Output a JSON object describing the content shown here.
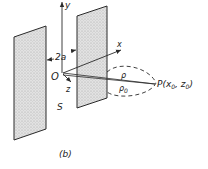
{
  "figure": {
    "caption": "(b)",
    "labels": {
      "y_axis": "y",
      "x_axis": "x",
      "z_axis": "z",
      "origin": "O",
      "gap": "2a",
      "slit": "S",
      "rho": "ρ",
      "rho0": "ρ",
      "rho0_sub": "0",
      "point": "P(x",
      "point_sub1": "0",
      "point_mid": ", z",
      "point_sub2": "0",
      "point_close": ")"
    },
    "colors": {
      "line": "#2a2a2a",
      "plate_fill": "#d9d9d9"
    }
  }
}
